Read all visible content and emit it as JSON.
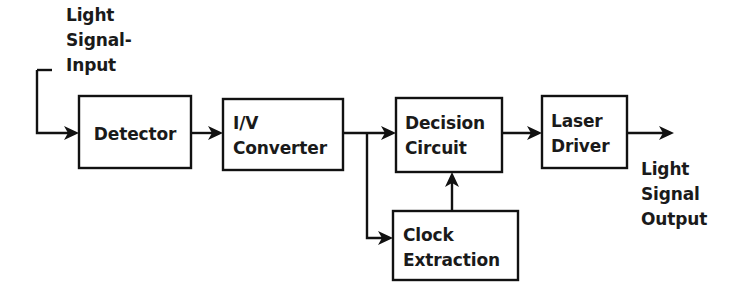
{
  "diagram": {
    "colors": {
      "background": "#ffffff",
      "stroke": "#111111",
      "text": "#1a1a1a"
    },
    "blocks": [
      {
        "id": "detector",
        "label_lines": [
          "Detector"
        ],
        "x": 79,
        "y": 96,
        "width": 112,
        "height": 72,
        "text_align": "center"
      },
      {
        "id": "iv-converter",
        "label_lines": [
          "I/V",
          "Converter"
        ],
        "x": 223,
        "y": 99,
        "width": 120,
        "height": 71,
        "text_align": "left"
      },
      {
        "id": "decision-circuit",
        "label_lines": [
          "Decision",
          "Circuit"
        ],
        "x": 396,
        "y": 98,
        "width": 106,
        "height": 74,
        "text_align": "left"
      },
      {
        "id": "laser-driver",
        "label_lines": [
          "Laser",
          "Driver"
        ],
        "x": 542,
        "y": 96,
        "width": 85,
        "height": 72,
        "text_align": "left"
      },
      {
        "id": "clock-extraction",
        "label_lines": [
          "Clock",
          "Extraction"
        ],
        "x": 393,
        "y": 211,
        "width": 125,
        "height": 69,
        "text_align": "left"
      }
    ],
    "labels": [
      {
        "id": "input-label",
        "lines": [
          "Light",
          "Signal-",
          "Input"
        ],
        "x": 66,
        "y": 21
      },
      {
        "id": "output-label",
        "lines": [
          "Light",
          "Signal",
          "Output"
        ],
        "x": 641,
        "y": 175
      }
    ],
    "connections": [
      {
        "id": "light-signal-input-to-detector",
        "from": "light-signal-input",
        "to": "detector",
        "path": "M 37 70 L 37 133 L 73 133"
      },
      {
        "id": "input-stub-top",
        "from": "light-signal-input",
        "to": "light-signal-input",
        "path": "M 37 70 L 52 70"
      },
      {
        "id": "detector-to-iv-converter",
        "from": "detector",
        "to": "iv-converter",
        "path": "M 191 133 L 217 133"
      },
      {
        "id": "iv-converter-to-decision-circuit",
        "from": "iv-converter",
        "to": "decision-circuit",
        "path": "M 343 133 L 390 133"
      },
      {
        "id": "iv-converter-to-clock-extraction",
        "from": "iv-converter",
        "to": "clock-extraction",
        "path": "M 367 133 L 367 238 L 387 238"
      },
      {
        "id": "clock-extraction-to-decision-circuit",
        "from": "clock-extraction",
        "to": "decision-circuit",
        "path": "M 452 211 L 452 178"
      },
      {
        "id": "decision-circuit-to-laser-driver",
        "from": "decision-circuit",
        "to": "laser-driver",
        "path": "M 502 133 L 536 133"
      },
      {
        "id": "laser-driver-to-light-signal-output",
        "from": "laser-driver",
        "to": "light-signal-output",
        "path": "M 627 133 L 666 133"
      }
    ]
  }
}
